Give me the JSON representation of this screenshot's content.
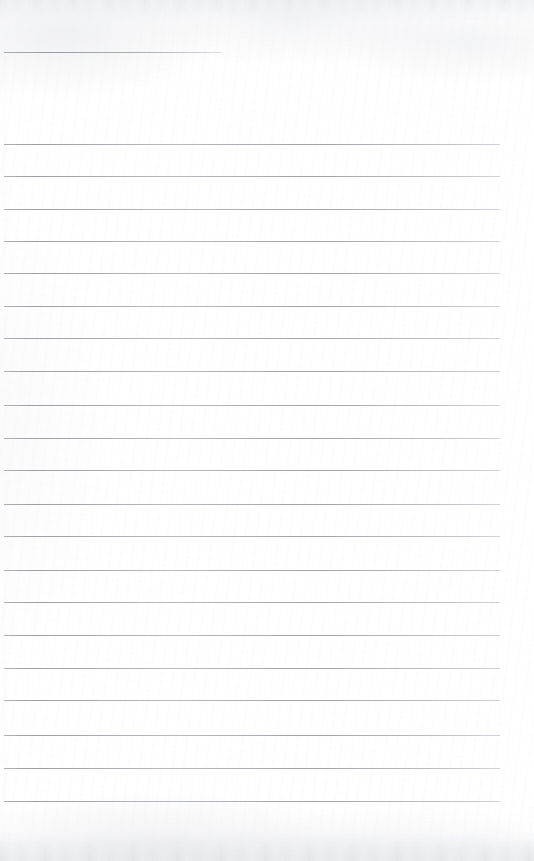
{
  "document": {
    "kind": "scanned-ruled-notebook-page",
    "title": "Blank ruled notebook page",
    "content_text": "",
    "page_width": 534,
    "page_height": 861,
    "paper_color": "#fdfdfd",
    "rule_color": "#9da0a8",
    "rule_thickness": 1,
    "rule_spacing": 32.4,
    "left_margin": 4,
    "right_margin": 34,
    "written_text_present": false,
    "header_rule": {
      "name": "short-header-rule",
      "x": 4,
      "y": 52,
      "width": 218
    },
    "rules": [
      {
        "y": 52,
        "x": 4,
        "width": 218,
        "short": true
      },
      {
        "y": 144,
        "x": 4,
        "width": 496,
        "short": false
      },
      {
        "y": 176,
        "x": 4,
        "width": 496,
        "short": false
      },
      {
        "y": 209,
        "x": 4,
        "width": 496,
        "short": false
      },
      {
        "y": 241,
        "x": 4,
        "width": 496,
        "short": false
      },
      {
        "y": 273,
        "x": 4,
        "width": 496,
        "short": false
      },
      {
        "y": 306,
        "x": 4,
        "width": 496,
        "short": false
      },
      {
        "y": 338,
        "x": 4,
        "width": 496,
        "short": false
      },
      {
        "y": 371,
        "x": 4,
        "width": 496,
        "short": false
      },
      {
        "y": 405,
        "x": 4,
        "width": 496,
        "short": false
      },
      {
        "y": 438,
        "x": 4,
        "width": 496,
        "short": false
      },
      {
        "y": 470,
        "x": 4,
        "width": 496,
        "short": false
      },
      {
        "y": 504,
        "x": 4,
        "width": 496,
        "short": false
      },
      {
        "y": 536,
        "x": 4,
        "width": 496,
        "short": false
      },
      {
        "y": 570,
        "x": 4,
        "width": 496,
        "short": false
      },
      {
        "y": 602,
        "x": 4,
        "width": 496,
        "short": false
      },
      {
        "y": 635,
        "x": 4,
        "width": 496,
        "short": false
      },
      {
        "y": 668,
        "x": 4,
        "width": 496,
        "short": false
      },
      {
        "y": 700,
        "x": 4,
        "width": 496,
        "short": false
      },
      {
        "y": 735,
        "x": 4,
        "width": 496,
        "short": false
      },
      {
        "y": 768,
        "x": 4,
        "width": 496,
        "short": false
      },
      {
        "y": 801,
        "x": 4,
        "width": 496,
        "short": false
      }
    ]
  }
}
